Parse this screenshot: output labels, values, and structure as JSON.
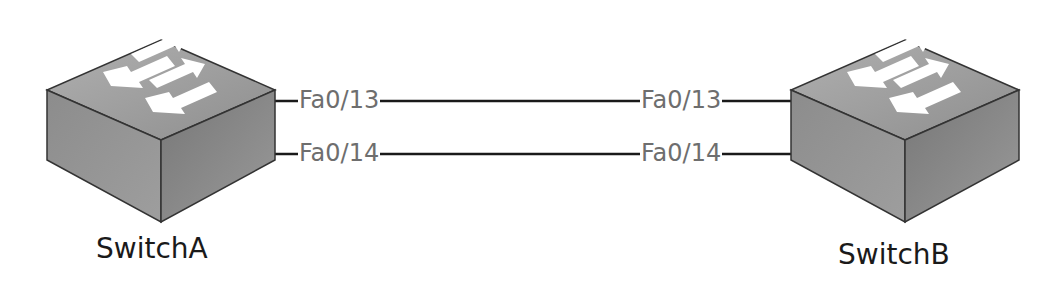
{
  "devices": [
    {
      "name": "SwitchA",
      "type": "switch",
      "icon": "switch-icon"
    },
    {
      "name": "SwitchB",
      "type": "switch",
      "icon": "switch-icon"
    }
  ],
  "links": [
    {
      "a_port": "Fa0/13",
      "b_port": "Fa0/13"
    },
    {
      "a_port": "Fa0/14",
      "b_port": "Fa0/14"
    }
  ],
  "colors": {
    "line": "#1a1a1a",
    "port_text": "#6e6e6e",
    "label_text": "#1a1a1a",
    "switch_top": "#9a9a9a",
    "switch_left": "#8a8a8a",
    "switch_right": "#7a7a7a"
  }
}
